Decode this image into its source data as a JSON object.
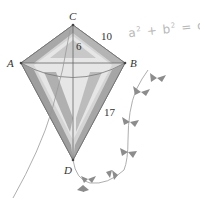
{
  "figure": {
    "type": "geometry-kite-diagram",
    "vertices": {
      "C": {
        "label": "C",
        "x": 73,
        "y": 25
      },
      "A": {
        "label": "A",
        "x": 21,
        "y": 63
      },
      "B": {
        "label": "B",
        "x": 125,
        "y": 63
      },
      "D": {
        "label": "D",
        "x": 73,
        "y": 160
      }
    },
    "measurements": {
      "CB": "10",
      "C_to_center": "6",
      "BD": "17"
    },
    "equation": {
      "a": "a",
      "b": "b",
      "c": "c",
      "exp": "2",
      "plus": "+",
      "equals": "="
    },
    "colors": {
      "kite_dark": "#9a9a9a",
      "kite_mid": "#c4c4c4",
      "kite_light": "#e4e4e4",
      "line": "#666666",
      "bow": "#8c8c8c",
      "string": "#999999",
      "equation": "#b8b8b8"
    }
  }
}
